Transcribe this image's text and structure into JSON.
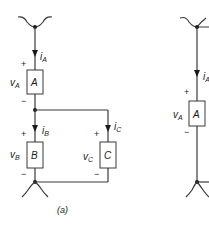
{
  "figure": {
    "caption": "(a)",
    "left_circuit": {
      "elements": [
        {
          "id": "A",
          "label": "A",
          "voltage_main": "v",
          "voltage_sub": "A",
          "current_main": "i",
          "current_sub": "A"
        },
        {
          "id": "B",
          "label": "B",
          "voltage_main": "v",
          "voltage_sub": "B",
          "current_main": "i",
          "current_sub": "B"
        },
        {
          "id": "C",
          "label": "C",
          "voltage_main": "v",
          "voltage_sub": "C",
          "current_main": "i",
          "current_sub": "C"
        }
      ],
      "plus": "+",
      "minus": "−"
    },
    "right_circuit": {
      "elements": [
        {
          "id": "A",
          "label": "A",
          "voltage_main": "v",
          "voltage_sub": "A",
          "current_main": "i",
          "current_sub": "A"
        }
      ],
      "plus": "+",
      "minus": "−"
    }
  }
}
